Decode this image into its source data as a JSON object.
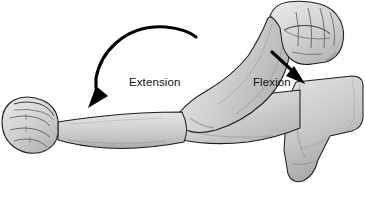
{
  "figure": {
    "background_color": "#ffffff",
    "outline_color": "#1a1a1a",
    "skin_fill_light": "#d8d8d8",
    "skin_fill_mid": "#c6c6c6",
    "skin_fill_shadow": "#a9a9a9",
    "skin_fill_highlight": "#e9e9e9",
    "arrow_color": "#000000",
    "label_color": "#111111"
  },
  "annotations": [
    {
      "id": "extension",
      "label": "Extension",
      "arrow_type": "curved-arc",
      "arrow_direction": "down-left",
      "label_x": 129,
      "label_y": 77
    },
    {
      "id": "flexion",
      "label": "Flexion",
      "arrow_type": "straight",
      "arrow_direction": "down-right",
      "label_x": 253,
      "label_y": 77
    }
  ],
  "anatomy_parts": [
    {
      "id": "extended-forearm",
      "name": "Extended forearm"
    },
    {
      "id": "extended-fist",
      "name": "Left clenched fist"
    },
    {
      "id": "flexed-forearm",
      "name": "Flexed forearm"
    },
    {
      "id": "flexed-fist",
      "name": "Raised clenched fist"
    },
    {
      "id": "upper-arm",
      "name": "Upper arm"
    },
    {
      "id": "shoulder",
      "name": "Shoulder"
    },
    {
      "id": "elbow",
      "name": "Elbow joint"
    }
  ]
}
